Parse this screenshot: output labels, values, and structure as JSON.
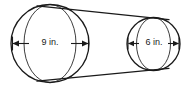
{
  "figure": {
    "name": "truncated-cone-frustum-diagram",
    "background_color": "#ffffff",
    "stroke_color": "#1a1a1a",
    "label_color": "#1a1a1a"
  },
  "dimensions": {
    "left": {
      "label": "9 in.",
      "value": 9,
      "unit": "in.",
      "measures": "diameter of large circular face"
    },
    "right": {
      "label": "6 in.",
      "value": 6,
      "unit": "in.",
      "measures": "diameter of small circular face"
    }
  },
  "geometry": {
    "large_circle": {
      "cx": 50.0,
      "cy": 43.5,
      "r": 39.0
    },
    "large_ellipse": {
      "cx": 50.0,
      "cy": 43.5,
      "rx": 26.0,
      "ry": 39.0
    },
    "small_circle": {
      "cx": 153.5,
      "cy": 44.0,
      "r": 26.5
    },
    "small_ellipse": {
      "cx": 153.5,
      "cy": 44.0,
      "rx": 17.0,
      "ry": 26.5
    },
    "tangent_top": {
      "x1": 38.0,
      "y1": 6.0,
      "x2": 168.0,
      "y2": 19.5
    },
    "tangent_bottom": {
      "x1": 38.0,
      "y1": 81.0,
      "x2": 168.0,
      "y2": 68.5
    },
    "arrow_left": {
      "x1": 12.5,
      "x2": 88.5,
      "y": 43.5
    },
    "arrow_right": {
      "x1": 128.0,
      "x2": 179.0,
      "y": 43.5
    }
  }
}
